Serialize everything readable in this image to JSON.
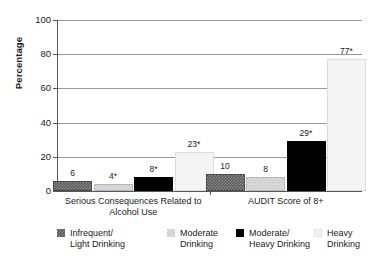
{
  "chart_data": {
    "type": "bar",
    "title": "",
    "subtitle": "",
    "xlabel": "",
    "ylabel": "Percentage",
    "ylim": [
      0,
      100
    ],
    "yticks": [
      0,
      20,
      40,
      60,
      80,
      100
    ],
    "ytick_labels": [
      "0",
      "20",
      "40",
      "60",
      "80",
      "100"
    ],
    "grid": "horizontal",
    "legend_position": "bottom",
    "categories": [
      "Serious Consequences Related to Alcohol Use",
      "AUDIT Score of 8+"
    ],
    "category_lines": [
      [
        "Serious Consequences Related to",
        "Alcohol Use"
      ],
      [
        "AUDIT Score of 8+"
      ]
    ],
    "series": [
      {
        "name": "Infrequent/Light Drinking",
        "name_lines": [
          "Infrequent/",
          "Light Drinking"
        ],
        "color": "#595959",
        "pattern": "checker-dark",
        "values": [
          6,
          10
        ],
        "labels": [
          "6",
          "10"
        ]
      },
      {
        "name": "Moderate Drinking",
        "name_lines": [
          "Moderate",
          "Drinking"
        ],
        "color": "#c9c9c9",
        "pattern": "checker-light",
        "values": [
          4,
          8
        ],
        "labels": [
          "4*",
          "8"
        ]
      },
      {
        "name": "Moderate/Heavy Drinking",
        "name_lines": [
          "Moderate/",
          "Heavy Drinking"
        ],
        "color": "#000000",
        "pattern": "solid",
        "values": [
          8,
          29
        ],
        "labels": [
          "8*",
          "29*"
        ]
      },
      {
        "name": "Heavy Drinking",
        "name_lines": [
          "Heavy",
          "Drinking"
        ],
        "color": "#f4f4f4",
        "pattern": "solid",
        "values": [
          23,
          77
        ],
        "labels": [
          "23*",
          "77*"
        ]
      }
    ],
    "annotations": [
      "* denotes statistical significance"
    ]
  }
}
